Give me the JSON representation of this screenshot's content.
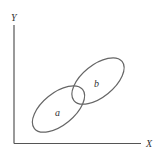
{
  "diagram": {
    "type": "venn-scatter-ellipses",
    "axes": {
      "x_label": "X",
      "y_label": "Y"
    },
    "regions": [
      {
        "id": "a",
        "label": "a"
      },
      {
        "id": "b",
        "label": "b"
      }
    ],
    "colors": {
      "stroke": "#555555",
      "text": "#333333",
      "background": "#ffffff"
    }
  }
}
